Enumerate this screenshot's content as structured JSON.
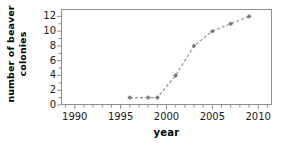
{
  "chart_data": {
    "type": "line",
    "title": "",
    "xlabel": "year",
    "ylabel": "number of beaver colonies",
    "ylabel_line1": "number of beaver",
    "ylabel_line2": "colonies",
    "xlim": [
      1988.5,
      2011.5
    ],
    "ylim": [
      0,
      13
    ],
    "xticks": [
      1990,
      1995,
      2000,
      2005,
      2010
    ],
    "xtick_labels": [
      "1990",
      "1995",
      "2000",
      "2005",
      "2010"
    ],
    "xminor_step": 1,
    "yticks": [
      0,
      2,
      4,
      6,
      8,
      10,
      12
    ],
    "ytick_labels": [
      "0",
      "2",
      "4",
      "6",
      "8",
      "10",
      "12"
    ],
    "grid": false,
    "legend": false,
    "x": [
      1996,
      1998,
      1999,
      2001,
      2003,
      2005,
      2007,
      2009
    ],
    "values": [
      1,
      1,
      1,
      4,
      8,
      10,
      11,
      12
    ],
    "series": [
      {
        "name": "beaver colonies",
        "x": [
          1996,
          1998,
          1999,
          2001,
          2003,
          2005,
          2007,
          2009
        ],
        "values": [
          1,
          1,
          1,
          4,
          8,
          10,
          11,
          12
        ]
      }
    ],
    "marker": "diamond",
    "marker_color": "#7a7a7a",
    "line_style": "dashed",
    "line_color": "#8a8a8a",
    "frame_color": "#8d8d8d",
    "background": "#ffffff",
    "text_color": "#1a1a1a"
  }
}
